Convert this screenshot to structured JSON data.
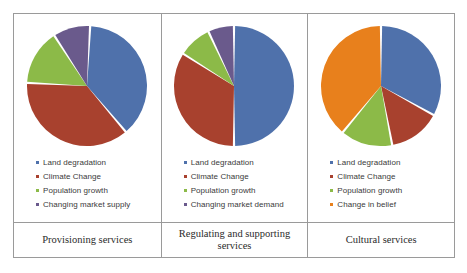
{
  "colors": {
    "blue": "#4f71ab",
    "red": "#a8412e",
    "green": "#8cba48",
    "purple": "#6a5a8c",
    "orange": "#e8801c",
    "border": "#9a9a9a",
    "slice_gap": "#ffffff"
  },
  "panels": [
    {
      "caption": "Provisioning services",
      "legend": [
        {
          "label": "Land degradation",
          "color": "#4f71ab"
        },
        {
          "label": "Climate Change",
          "color": "#a8412e"
        },
        {
          "label": "Population growth",
          "color": "#8cba48"
        },
        {
          "label": "Changing market supply",
          "color": "#6a5a8c"
        }
      ]
    },
    {
      "caption": "Regulating and supporting services",
      "legend": [
        {
          "label": "Land degradation",
          "color": "#4f71ab"
        },
        {
          "label": "Climate Change",
          "color": "#a8412e"
        },
        {
          "label": "Population growth",
          "color": "#8cba48"
        },
        {
          "label": "Changing market demand",
          "color": "#6a5a8c"
        }
      ]
    },
    {
      "caption": "Cultural services",
      "legend": [
        {
          "label": "Land degradation",
          "color": "#4f71ab"
        },
        {
          "label": "Climate Change",
          "color": "#a8412e"
        },
        {
          "label": "Population growth",
          "color": "#8cba48"
        },
        {
          "label": "Change in belief",
          "color": "#e8801c"
        }
      ]
    }
  ],
  "chart_data": [
    {
      "type": "pie",
      "title": "Provisioning services",
      "labels": [
        "Land degradation",
        "Climate Change",
        "Population growth",
        "Changing market supply"
      ],
      "values": [
        38,
        37,
        15,
        10
      ],
      "colors": [
        "#4f71ab",
        "#a8412e",
        "#8cba48",
        "#6a5a8c"
      ],
      "start_angle": 3,
      "legend": "bottom"
    },
    {
      "type": "pie",
      "title": "Regulating and supporting services",
      "labels": [
        "Land degradation",
        "Climate Change",
        "Population growth",
        "Changing market demand"
      ],
      "values": [
        50,
        34,
        9,
        7
      ],
      "colors": [
        "#4f71ab",
        "#a8412e",
        "#8cba48",
        "#6a5a8c"
      ],
      "start_angle": 0,
      "legend": "bottom"
    },
    {
      "type": "pie",
      "title": "Cultural services",
      "labels": [
        "Land degradation",
        "Climate Change",
        "Population growth",
        "Change in belief"
      ],
      "values": [
        33,
        14,
        14,
        39
      ],
      "colors": [
        "#4f71ab",
        "#a8412e",
        "#8cba48",
        "#e8801c"
      ],
      "start_angle": 0,
      "legend": "bottom"
    }
  ]
}
